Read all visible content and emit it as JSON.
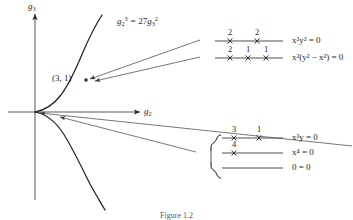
{
  "figure": {
    "caption": "Figure 1.2",
    "ink_color": "#1f1f1f"
  },
  "plot": {
    "y_axis_label_base": "g",
    "y_axis_label_sub": "3",
    "x_axis_label_base": "g",
    "x_axis_label_sub": "2",
    "curve_label": {
      "lhs_base": "g",
      "lhs_sub": "2",
      "lhs_sup": "3",
      "equals": "=",
      "rhs_coeff": "27",
      "rhs_base": "g",
      "rhs_sub": "3",
      "rhs_sup": "2"
    },
    "point_label": "(3, 1)"
  },
  "upper_group": {
    "rows": [
      {
        "equation_html": "x²y² = 0",
        "equation_plain": "x2y2 = 0",
        "multiplicities": [
          "2",
          "2"
        ]
      },
      {
        "equation_html": "x²(y² − x²) = 0",
        "equation_plain": "x2(y2 - x2) = 0",
        "multiplicities": [
          "2",
          "1",
          "1"
        ]
      }
    ]
  },
  "lower_group": {
    "brace": "{",
    "rows": [
      {
        "equation_html": "x³y = 0",
        "equation_plain": "x3y = 0",
        "multiplicities": [
          "3",
          "1"
        ]
      },
      {
        "equation_html": "x⁴ = 0",
        "equation_plain": "x4 = 0",
        "multiplicities": [
          "4"
        ]
      },
      {
        "equation_html": "0 = 0",
        "equation_plain": "0 = 0",
        "multiplicities": []
      }
    ]
  }
}
